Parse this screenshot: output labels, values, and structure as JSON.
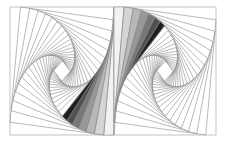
{
  "figure": {
    "width": 228,
    "height": 143,
    "left_panel": {
      "x0": 10,
      "y0": 7,
      "x1": 114,
      "y1": 135
    },
    "right_panel": {
      "x0": 114,
      "y0": 7,
      "x1": 216,
      "y1": 135
    },
    "pursuit_ratio": 0.1,
    "iterations": 22,
    "shaded_steps": 7,
    "stroke_color": "#8a8a8a",
    "frame_color": "#9a9a9a",
    "shade_colors": [
      "#f2f2f2",
      "#d4d4d4",
      "#b8b8b8",
      "#989898",
      "#777777",
      "#4f4f4f",
      "#1e1e1e"
    ]
  }
}
